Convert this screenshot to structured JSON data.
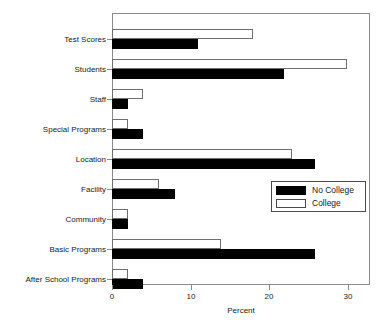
{
  "chart_data": {
    "type": "bar",
    "orientation": "horizontal",
    "title": "",
    "xlabel": "Percent",
    "ylabel": "",
    "xlim": [
      0,
      33
    ],
    "xticks": [
      0,
      10,
      20,
      30
    ],
    "xtick_labels": [
      "0",
      "10",
      "20",
      "30"
    ],
    "grid": false,
    "legend_position": "center-right",
    "categories": [
      "Test Scores",
      "Students",
      "Staff",
      "Special Programs",
      "Location",
      "Facility",
      "Community",
      "Basic Programs",
      "After School Programs"
    ],
    "series": [
      {
        "name": "No College",
        "color": "#000000",
        "values": [
          11,
          22,
          2,
          4,
          26,
          8,
          2,
          26,
          4
        ]
      },
      {
        "name": "College",
        "color": "#ffffff",
        "values": [
          18,
          30,
          4,
          2,
          23,
          6,
          2,
          14,
          2
        ]
      }
    ]
  },
  "legend": {
    "entries": [
      {
        "label": "No College",
        "swatch": "filled-black-swatch"
      },
      {
        "label": "College",
        "swatch": "outlined-white-swatch"
      }
    ]
  },
  "axis": {
    "x_title": "Percent"
  }
}
